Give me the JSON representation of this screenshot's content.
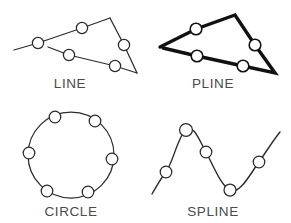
{
  "page": {
    "background_color": "#ffffff",
    "stroke_color": "#2b2b2b",
    "heavy_stroke_color": "#111111",
    "node_fill_color": "#ffffff",
    "caption_color": "#4a4a4a",
    "width": 291,
    "height": 223
  },
  "figures": [
    {
      "id": "line",
      "caption": "LINE",
      "caption_x": 70,
      "caption_y": 88,
      "stroke_style": "thin",
      "description": "two separate straight line segments with open grip markers",
      "polylines": [
        {
          "points": "14,50 38,43 82,28 110,18"
        },
        {
          "points": "48,47 69,55 115,66 137,73"
        }
      ],
      "extra_segments": [
        {
          "points": "110,18 124,45 137,73"
        }
      ],
      "nodes": [
        {
          "cx": 38,
          "cy": 43,
          "r": 5.6
        },
        {
          "cx": 82,
          "cy": 28,
          "r": 5.6
        },
        {
          "cx": 124,
          "cy": 45,
          "r": 5.6
        },
        {
          "cx": 69,
          "cy": 55,
          "r": 5.6
        },
        {
          "cx": 115,
          "cy": 66,
          "r": 5.6
        }
      ]
    },
    {
      "id": "pline",
      "caption": "PLINE",
      "caption_x": 213,
      "caption_y": 88,
      "stroke_style": "thick",
      "description": "single connected heavy polyline with open grip markers",
      "polylines": [
        {
          "points": "160,47 196,29 235,15 255,45 275,73 243,66 197,56 163,48"
        }
      ],
      "extra_segments": [],
      "nodes": [
        {
          "cx": 196,
          "cy": 29,
          "r": 5.8
        },
        {
          "cx": 255,
          "cy": 45,
          "r": 5.8
        },
        {
          "cx": 243,
          "cy": 66,
          "r": 5.8
        },
        {
          "cx": 197,
          "cy": 56,
          "r": 5.8
        }
      ]
    },
    {
      "id": "circle",
      "caption": "CIRCLE",
      "caption_x": 71,
      "caption_y": 216,
      "stroke_style": "thin",
      "description": "closed circle with six evenly spaced open grip markers",
      "circle": {
        "cx": 71,
        "cy": 155,
        "r": 43
      },
      "nodes": [
        {
          "cx": 55,
          "cy": 117,
          "r": 5.8
        },
        {
          "cx": 95,
          "cy": 121,
          "r": 5.8
        },
        {
          "cx": 112,
          "cy": 159,
          "r": 5.8
        },
        {
          "cx": 88,
          "cy": 192,
          "r": 5.8
        },
        {
          "cx": 47,
          "cy": 191,
          "r": 5.8
        },
        {
          "cx": 29,
          "cy": 153,
          "r": 5.8
        }
      ]
    },
    {
      "id": "spline",
      "caption": "SPLINE",
      "caption_x": 213,
      "caption_y": 216,
      "stroke_style": "curve",
      "description": "smooth wavy spline curve with five open grip markers",
      "path": "M 152,194 C 158,184 161,178 166,172 C 174,160 178,136 186,130 C 194,124 199,140 206,152 C 213,165 221,186 230,190 C 240,195 250,174 259,162 C 266,152 272,142 280,132",
      "nodes": [
        {
          "cx": 166,
          "cy": 172,
          "r": 5.8
        },
        {
          "cx": 186,
          "cy": 130,
          "r": 6.4
        },
        {
          "cx": 206,
          "cy": 152,
          "r": 5.8
        },
        {
          "cx": 230,
          "cy": 190,
          "r": 6.0
        },
        {
          "cx": 259,
          "cy": 162,
          "r": 5.8
        }
      ]
    }
  ]
}
